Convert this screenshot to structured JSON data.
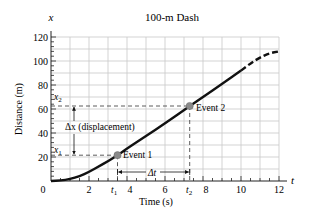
{
  "chart_data": {
    "type": "line",
    "title": "100-m Dash",
    "xlabel": "Time (s)",
    "ylabel": "Distance (m)",
    "x_axis_symbol": "t",
    "y_axis_symbol": "x",
    "xlim": [
      0,
      12
    ],
    "ylim": [
      0,
      120
    ],
    "x_ticks": [
      0,
      2,
      4,
      6,
      8,
      10,
      12
    ],
    "x_tick_labels": [
      "0",
      "2",
      "4",
      "6",
      "8",
      "10",
      "12"
    ],
    "y_ticks": [
      20,
      40,
      60,
      80,
      100,
      120
    ],
    "y_tick_labels": [
      "20",
      "40",
      "60",
      "80",
      "100",
      "120"
    ],
    "grid": true,
    "series": [
      {
        "name": "Runner position",
        "style": "solid",
        "x": [
          0,
          0.5,
          1,
          1.5,
          2,
          2.5,
          3,
          3.5,
          4,
          5,
          6,
          7,
          8,
          9,
          10
        ],
        "y": [
          0,
          0.3,
          1.5,
          4,
          7.5,
          12,
          16.5,
          21.5,
          27,
          37.5,
          48,
          59,
          70,
          81,
          92
        ]
      },
      {
        "name": "Extrapolated",
        "style": "dashed",
        "x": [
          10,
          10.5,
          11,
          11.5,
          12
        ],
        "y": [
          92,
          98,
          103,
          106.5,
          108
        ]
      }
    ],
    "events": [
      {
        "label": "Event 1",
        "t": 3.5,
        "x": 21.5,
        "t_label": "t1",
        "x_label": "x1"
      },
      {
        "label": "Event 2",
        "t": 7.3,
        "x": 62.5,
        "t_label": "t2",
        "x_label": "x2"
      }
    ],
    "annotations": [
      {
        "text": "Δx (displacement)",
        "type": "vertical-arrow",
        "from": "x1",
        "to": "x2"
      },
      {
        "text": "Δt",
        "type": "horizontal-arrow",
        "from": "t1",
        "to": "t2"
      }
    ]
  },
  "labels": {
    "title": "100-m Dash",
    "xlabel": "Time (s)",
    "ylabel": "Distance (m)",
    "x_symbol": "t",
    "y_symbol": "x",
    "event1": "Event 1",
    "event2": "Event 2",
    "dx": "Δx (displacement)",
    "dt": "Δt",
    "t1": "t",
    "t1_sub": "1",
    "t2": "t",
    "t2_sub": "2",
    "x1": "x",
    "x1_sub": "1",
    "x2": "x",
    "x2_sub": "2"
  },
  "colors": {
    "curve": "#111111",
    "grid": "#c8c8c8",
    "axis": "#222222",
    "marker": "#8a8a8a",
    "dashed_guides": "#333333"
  }
}
